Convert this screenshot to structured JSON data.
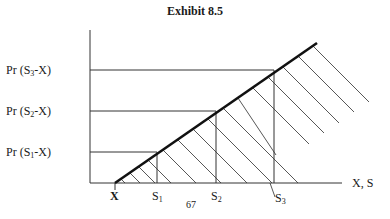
{
  "title": "Exhibit 8.5",
  "y_labels": [
    {
      "prefix": "Pr (S",
      "sub": "3",
      "suffix": "-X)"
    },
    {
      "prefix": "Pr (S",
      "sub": "2",
      "suffix": "-X)"
    },
    {
      "prefix": "Pr (S",
      "sub": "1",
      "suffix": "-X)"
    }
  ],
  "x_labels": {
    "origin": "X",
    "s1": {
      "base": "S",
      "sub": "1"
    },
    "s2": {
      "base": "S",
      "sub": "2"
    },
    "s3": {
      "base": "S",
      "sub": "3"
    },
    "axis": "X, S"
  },
  "page_number": "67",
  "colors": {
    "line": "#333333",
    "payoff_line": "#111111",
    "background": "#ffffff"
  }
}
